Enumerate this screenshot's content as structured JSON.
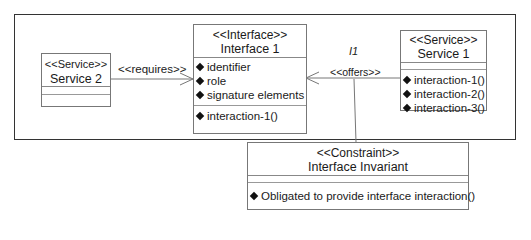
{
  "diagram": {
    "type": "UML class diagram",
    "nodes": {
      "service2": {
        "stereotype": "<<Service>>",
        "name": "Service 2",
        "attributes": [],
        "operations": []
      },
      "interface1": {
        "stereotype": "<<Interface>>",
        "name": "Interface 1",
        "attributes": [
          "identifier",
          "role",
          "signature elements"
        ],
        "operations": [
          "interaction-1()"
        ]
      },
      "service1": {
        "stereotype": "<<Service>>",
        "name": "Service 1",
        "attributes": [],
        "operations": [
          "interaction-1()",
          "interaction-2()",
          "interaction-3()"
        ]
      },
      "constraint": {
        "stereotype": "<<Constraint>>",
        "name": "Interface Invariant",
        "attributes": [],
        "operations": [
          "Obligated to provide interface interaction()"
        ]
      }
    },
    "edges": {
      "requires": {
        "label": "<<requires>>",
        "from": "Service 2",
        "to": "Interface 1"
      },
      "offers": {
        "label": "<<offers>>",
        "name": "I1",
        "from": "Service 1",
        "to": "Interface 1"
      },
      "constraint_link": {
        "from": "<<offers>>",
        "to": "Interface Invariant"
      }
    }
  }
}
